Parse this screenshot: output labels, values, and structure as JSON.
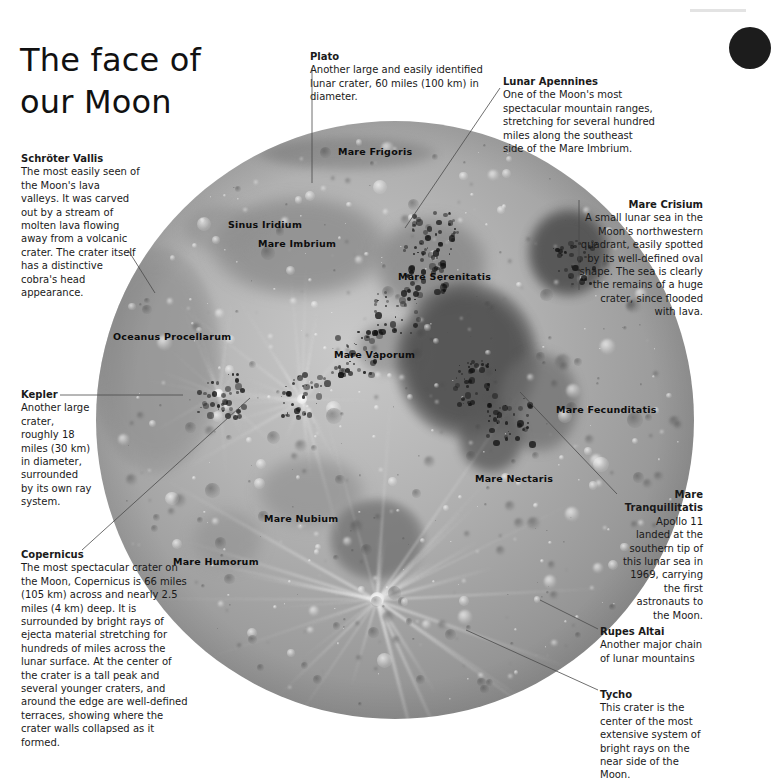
{
  "page": {
    "title": "The face of our Moon",
    "title_line1": "The face of",
    "title_line2": "our Moon",
    "background": "#ffffff",
    "text_color": "#1a1a1a"
  },
  "decor": {
    "corner_blob_name": "dark-circle-decoration",
    "corner_blob_color": "#1c1c1c",
    "top_rule_color": "#e3e3e3"
  },
  "moon": {
    "name": "moon-photograph",
    "alt": "Full Moon near side photograph",
    "center_x": 395,
    "center_y": 420,
    "radius": 299
  },
  "surface_labels": [
    {
      "id": "mare-frigoris",
      "text": "Mare Frigoris",
      "x": 338,
      "y": 146
    },
    {
      "id": "sinus-iridium",
      "text": "Sinus Iridium",
      "x": 228,
      "y": 219
    },
    {
      "id": "mare-imbrium",
      "text": "Mare Imbrium",
      "x": 258,
      "y": 238
    },
    {
      "id": "mare-serenitatis",
      "text": "Mare Serenitatis",
      "x": 398,
      "y": 271
    },
    {
      "id": "oceanus-procellarum",
      "text": "Oceanus Procellarum",
      "x": 113,
      "y": 331
    },
    {
      "id": "mare-vaporum",
      "text": "Mare Vaporum",
      "x": 334,
      "y": 349
    },
    {
      "id": "mare-fecunditatis",
      "text": "Mare Fecunditatis",
      "x": 556,
      "y": 404
    },
    {
      "id": "mare-nectaris",
      "text": "Mare Nectaris",
      "x": 475,
      "y": 473
    },
    {
      "id": "mare-nubium",
      "text": "Mare Nubium",
      "x": 264,
      "y": 513
    },
    {
      "id": "mare-humorum",
      "text": "Mare Humorum",
      "x": 173,
      "y": 556
    }
  ],
  "callouts": [
    {
      "id": "schroter-vallis",
      "title": "Schröter Vallis",
      "body": "The most easily seen of the Moon's lava valleys. It was carved out by a stream of molten lava flowing away from a volcanic crater. The crater itself has a distinctive cobra's head appearance.",
      "align": "left",
      "x": 21,
      "y": 152,
      "w": 120
    },
    {
      "id": "plato",
      "title": "Plato",
      "body": "Another large and easily identified lunar crater, 60 miles (100 km) in diameter.",
      "align": "left",
      "x": 310,
      "y": 50,
      "w": 200
    },
    {
      "id": "lunar-apennines",
      "title": "Lunar Apennines",
      "body": "One of the Moon's most spectacular mountain ranges, stretching for several hundred miles along the southeast side of the Mare Imbrium.",
      "align": "left",
      "x": 503,
      "y": 75,
      "w": 152
    },
    {
      "id": "mare-crisium",
      "title": "Mare Crisium",
      "body": "A small lunar sea in the Moon's northwestern quadrant, easily spotted by its well-defined oval shape. The sea is clearly the remains of a huge crater, since flooded with lava.",
      "align": "right",
      "x": 578,
      "y": 198,
      "w": 125
    },
    {
      "id": "kepler",
      "title": "Kepler",
      "body": "Another large crater, roughly 18 miles (30 km) in diameter, surrounded by its own ray system.",
      "align": "left",
      "x": 21,
      "y": 388,
      "w": 72
    },
    {
      "id": "copernicus",
      "title": "Copernicus",
      "body": "The most spectacular crater on the Moon, Copernicus is 66 miles (105 km) across and nearly 2.5 miles (4 km) deep. It is surrounded by bright rays of ejecta material stretching for hundreds of miles across the lunar surface. At the center of the crater is a tall peak and several younger craters, and around the edge are well-defined terraces, showing where the crater walls collapsed as it formed.",
      "align": "left",
      "x": 21,
      "y": 548,
      "w": 170
    },
    {
      "id": "mare-tranquillitatis",
      "title": "Mare Tranquillitatis",
      "body": "Apollo 11 landed at the southern tip of this lunar sea in 1969, carrying the first astronauts to the Moon.",
      "align": "right",
      "x": 619,
      "y": 488,
      "w": 84
    },
    {
      "id": "rupes-altai",
      "title": "Rupes Altai",
      "body": "Another major chain of lunar mountains",
      "align": "left",
      "x": 600,
      "y": 625,
      "w": 110
    },
    {
      "id": "tycho",
      "title": "Tycho",
      "body": "This crater is the center of the most extensive system of bright rays on the near side of the Moon.",
      "align": "left",
      "x": 600,
      "y": 688,
      "w": 108
    }
  ],
  "leader_lines": [
    {
      "id": "leader-schroter-vallis",
      "points": "128,250 155,293"
    },
    {
      "id": "leader-plato",
      "points": "312,68 312,183"
    },
    {
      "id": "leader-lunar-apennines",
      "points": "500,88 405,228"
    },
    {
      "id": "leader-mare-crisium",
      "points": "579,200 579,290"
    },
    {
      "id": "leader-kepler",
      "points": "60,395 183,395"
    },
    {
      "id": "leader-copernicus",
      "points": "82,550 250,398"
    },
    {
      "id": "leader-mare-tranquillitatis",
      "points": "617,494 520,392"
    },
    {
      "id": "leader-rupes-altai",
      "points": "598,629 540,600"
    },
    {
      "id": "leader-tycho",
      "points": "598,690 466,630"
    }
  ]
}
